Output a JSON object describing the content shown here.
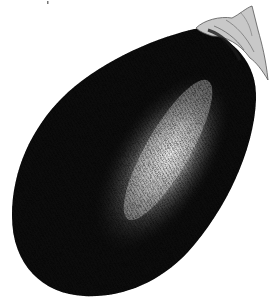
{
  "image": {
    "subject": "eggplant",
    "style": "engraving / stipple illustration",
    "alt": "Black and white engraved illustration of an eggplant"
  },
  "colors": {
    "background": "#ffffff",
    "body_dark": "#0d0d0d",
    "highlight": "#e8e8e8",
    "stem": "#bdbdbd"
  }
}
